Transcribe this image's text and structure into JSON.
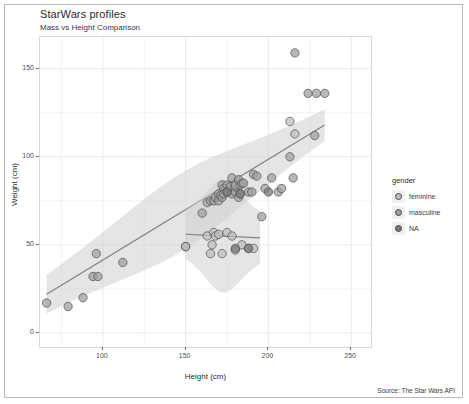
{
  "figure": {
    "title": "StarWars profiles",
    "subtitle": "Mass vs Height Comparison",
    "caption": "Source: The Star Wars API"
  },
  "legend": {
    "title": "gender",
    "items": [
      {
        "label": "feminine",
        "color": "#bdbdbd"
      },
      {
        "label": "masculine",
        "color": "#a0a0a0"
      },
      {
        "label": "NA",
        "color": "#7a7a7a"
      }
    ]
  },
  "chart_data": {
    "type": "scatter",
    "title": "StarWars profiles",
    "subtitle": "Mass vs Height Comparison",
    "xlabel": "Height (cm)",
    "ylabel": "Weight (cm)",
    "xlim": [
      62,
      262
    ],
    "ylim": [
      -8,
      168
    ],
    "xticks": [
      100,
      150,
      200,
      250
    ],
    "yticks": [
      0,
      50,
      100,
      150
    ],
    "grid": true,
    "legend_position": "right",
    "point_color_default": "#a0a0a0",
    "point_stroke": "#4f4f4f",
    "point_opacity": 0.75,
    "series": [
      {
        "name": "masculine",
        "color": "#a0a0a0",
        "points": [
          [
            66,
            17
          ],
          [
            79,
            15
          ],
          [
            88,
            20
          ],
          [
            94,
            32
          ],
          [
            96,
            45
          ],
          [
            97,
            32
          ],
          [
            112,
            40
          ],
          [
            150,
            49
          ],
          [
            160,
            68
          ],
          [
            163,
            74
          ],
          [
            165,
            75
          ],
          [
            167,
            75
          ],
          [
            168,
            77
          ],
          [
            170,
            75
          ],
          [
            170,
            79
          ],
          [
            171,
            78
          ],
          [
            172,
            77
          ],
          [
            172,
            84
          ],
          [
            173,
            82
          ],
          [
            173,
            79
          ],
          [
            175,
            80
          ],
          [
            175,
            84
          ],
          [
            177,
            83
          ],
          [
            178,
            79
          ],
          [
            178,
            88
          ],
          [
            180,
            80
          ],
          [
            180,
            83
          ],
          [
            180,
            84
          ],
          [
            182,
            77
          ],
          [
            182,
            87
          ],
          [
            183,
            84
          ],
          [
            183,
            79
          ],
          [
            184,
            85
          ],
          [
            185,
            85
          ],
          [
            188,
            80
          ],
          [
            190,
            80
          ],
          [
            191,
            90
          ],
          [
            193,
            89
          ],
          [
            196,
            66
          ],
          [
            198,
            82
          ],
          [
            202,
            88
          ],
          [
            206,
            80
          ],
          [
            208,
            82
          ],
          [
            213,
            100
          ],
          [
            215,
            88
          ],
          [
            216,
            159
          ],
          [
            224,
            136
          ],
          [
            228,
            112
          ],
          [
            229,
            136
          ],
          [
            234,
            136
          ]
        ]
      },
      {
        "name": "feminine",
        "color": "#bdbdbd",
        "points": [
          [
            150,
            49
          ],
          [
            163,
            55
          ],
          [
            165,
            45
          ],
          [
            166,
            50
          ],
          [
            167,
            57
          ],
          [
            168,
            55
          ],
          [
            170,
            56
          ],
          [
            172,
            45
          ],
          [
            175,
            57
          ],
          [
            178,
            55
          ],
          [
            180,
            47
          ],
          [
            184,
            50
          ],
          [
            188,
            48
          ],
          [
            191,
            48
          ],
          [
            213,
            120
          ],
          [
            216,
            113
          ]
        ]
      },
      {
        "name": "NA",
        "color": "#7a7a7a",
        "points": [
          [
            175,
            80
          ],
          [
            180,
            48
          ],
          [
            183,
            79
          ],
          [
            188,
            48
          ],
          [
            200,
            80
          ]
        ]
      }
    ],
    "fits": [
      {
        "name": "masculine-trend",
        "type": "linear-smooth",
        "x_range": [
          66,
          234
        ],
        "y_at_x_min": 22,
        "y_at_x_max": 118,
        "ribbon_half_width_min": 11,
        "ribbon_half_width_max": 9
      },
      {
        "name": "feminine-trend",
        "type": "linear-smooth",
        "x_range": [
          150,
          195
        ],
        "y_at_x_min": 56,
        "y_at_x_max": 54,
        "ribbon_half_width_min": 14,
        "ribbon_half_width_max": 15
      }
    ]
  }
}
